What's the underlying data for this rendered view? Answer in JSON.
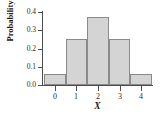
{
  "chart_data": {
    "type": "bar",
    "title": "",
    "subtitle": "",
    "xlabel": "X",
    "ylabel": "Probability",
    "categories": [
      "0",
      "1",
      "2",
      "3",
      "4"
    ],
    "values": [
      0.0625,
      0.25,
      0.375,
      0.25,
      0.0625
    ],
    "series": [
      {
        "name": "Probability",
        "values": [
          0.0625,
          0.25,
          0.375,
          0.25,
          0.0625
        ]
      }
    ],
    "xlim": [
      -0.5,
      4.5
    ],
    "ylim": [
      0.0,
      0.4
    ],
    "ytick_labels": [
      "0.0",
      "0.1",
      "0.2",
      "0.3",
      "0.4"
    ],
    "ytick_values": [
      0.0,
      0.1,
      0.2,
      0.3,
      0.4
    ],
    "xtick_labels": [
      "0",
      "1",
      "2",
      "3",
      "4"
    ],
    "xtick_values": [
      0,
      1,
      2,
      3,
      4
    ],
    "grid": false,
    "legend": false,
    "legend_position": "none",
    "bar_fill_color": "#d4d4d4",
    "bar_edge_color": "#8a8a8a",
    "axis_color": "#4d4d4d",
    "text_color": "#1a1a1a",
    "background_color": "#ffffff",
    "annotations": []
  }
}
